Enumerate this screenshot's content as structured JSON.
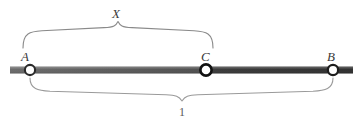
{
  "figure": {
    "colors": {
      "segment_left": "#585858",
      "segment_right": "#3b3b3b",
      "endpoint_stroke": "#1a1a1a",
      "endpoint_fill": "#ffffff",
      "brace_stroke": "#8a8a8a",
      "label_color": "#3a3a3a",
      "background": "#ffffff"
    },
    "points": [
      {
        "id": "A",
        "label": "A",
        "x": 30,
        "y": 70
      },
      {
        "id": "C",
        "label": "C",
        "x": 206,
        "y": 70
      },
      {
        "id": "B",
        "label": "B",
        "x": 333,
        "y": 70
      }
    ],
    "segment": {
      "start_x": 10,
      "end_x": 353,
      "y": 70,
      "thickness": 7
    },
    "braces": [
      {
        "id": "upper",
        "label": "X",
        "from_point": "A",
        "to_point": "C",
        "orientation": "up",
        "left_x": 23,
        "right_x": 213,
        "peak_x": 118,
        "label_x": 112,
        "label_y": 7
      },
      {
        "id": "lower",
        "label": "1",
        "from_point": "A",
        "to_point": "B",
        "orientation": "down",
        "left_x": 30,
        "right_x": 333,
        "valley_x": 182,
        "label_x": 179,
        "label_y": 106
      }
    ]
  }
}
